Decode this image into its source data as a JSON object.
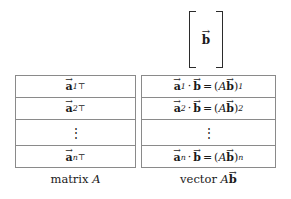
{
  "figure": {
    "background_color": "#ffffff",
    "line_color": "#8a8a8a",
    "text_color": "#1a1a1a"
  },
  "input_vector": {
    "label": "b",
    "accent": "arrow",
    "bracket": "square"
  },
  "matrix_a": {
    "caption_prefix": "matrix",
    "caption_symbol": "A",
    "rows": [
      {
        "vector": "a",
        "subscript": "1",
        "superscript": "⊤",
        "kind": "entry"
      },
      {
        "vector": "a",
        "subscript": "2",
        "superscript": "⊤",
        "kind": "entry"
      },
      {
        "vector": "",
        "subscript": "",
        "superscript": "",
        "kind": "ellipsis",
        "glyph": "⋮"
      },
      {
        "vector": "a",
        "subscript": "n",
        "superscript": "⊤",
        "kind": "entry"
      }
    ]
  },
  "vector_ab": {
    "caption_prefix": "vector",
    "caption_matrix": "A",
    "caption_vector": "b",
    "dot_operator": "·",
    "equals": "=",
    "rows": [
      {
        "left_vector": "a",
        "left_subscript": "1",
        "right_vector": "b",
        "result_matrix": "A",
        "result_vector": "b",
        "result_subscript": "1",
        "kind": "entry"
      },
      {
        "left_vector": "a",
        "left_subscript": "2",
        "right_vector": "b",
        "result_matrix": "A",
        "result_vector": "b",
        "result_subscript": "2",
        "kind": "entry"
      },
      {
        "kind": "ellipsis",
        "glyph": "⋮"
      },
      {
        "left_vector": "a",
        "left_subscript": "n",
        "right_vector": "b",
        "result_matrix": "A",
        "result_vector": "b",
        "result_subscript": "n",
        "kind": "entry"
      }
    ]
  },
  "glyphs": {
    "arrow": "→",
    "vdots": "⋮",
    "transpose": "⊤",
    "dot": "·",
    "equals": "="
  }
}
